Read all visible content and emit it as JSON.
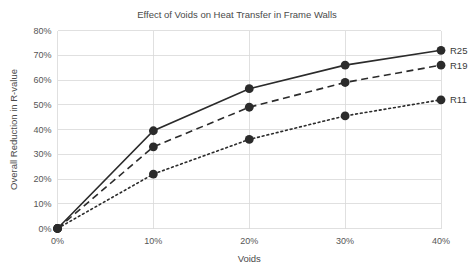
{
  "chart_data": {
    "type": "line",
    "title": "Effect of Voids on Heat Transfer in Frame Walls",
    "xlabel": "Voids",
    "ylabel": "Overall Reduction in R-value",
    "x": [
      0,
      10,
      20,
      30,
      40
    ],
    "xtick_labels": [
      "0%",
      "10%",
      "20%",
      "30%",
      "40%"
    ],
    "ytick_labels": [
      "0%",
      "10%",
      "20%",
      "30%",
      "40%",
      "50%",
      "60%",
      "70%",
      "80%"
    ],
    "yticks": [
      0,
      10,
      20,
      30,
      40,
      50,
      60,
      70,
      80
    ],
    "xlim": [
      0,
      40
    ],
    "ylim": [
      0,
      80
    ],
    "grid": true,
    "legend_position": "right-of-line-ends",
    "series": [
      {
        "name": "R25",
        "style": "solid",
        "color": "#2b2b2b",
        "values": [
          0,
          39.5,
          56.5,
          66,
          72
        ]
      },
      {
        "name": "R19",
        "style": "dashed",
        "color": "#2b2b2b",
        "values": [
          0,
          33,
          49,
          59,
          66
        ]
      },
      {
        "name": "R11",
        "style": "dotted",
        "color": "#2b2b2b",
        "values": [
          0,
          22,
          36,
          45.5,
          52
        ]
      }
    ]
  }
}
